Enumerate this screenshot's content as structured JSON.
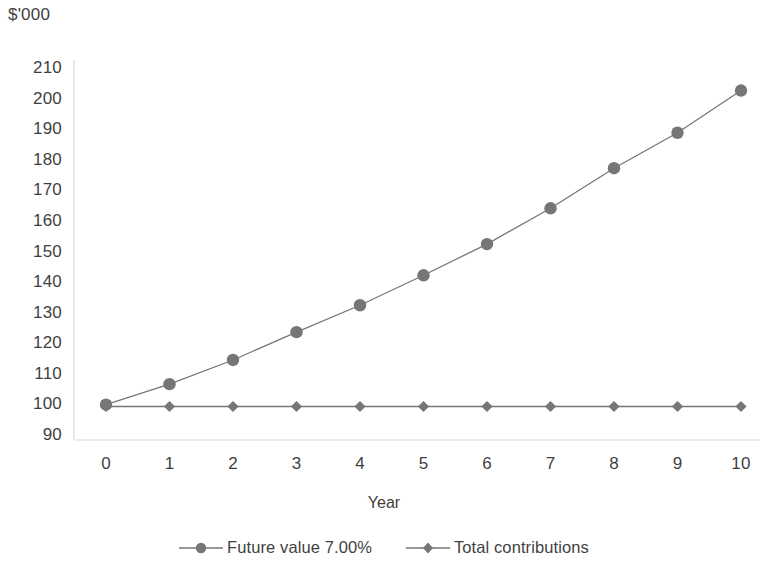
{
  "chart_data": {
    "type": "line",
    "title": "",
    "xlabel": "Year",
    "ylabel": "$'000",
    "x": [
      0,
      1,
      2,
      3,
      4,
      5,
      6,
      7,
      8,
      9,
      10
    ],
    "categories": [
      "0",
      "1",
      "2",
      "3",
      "4",
      "5",
      "6",
      "7",
      "8",
      "9",
      "10"
    ],
    "series": [
      {
        "name": "Future value 7.00%",
        "marker": "circle",
        "color": "#767676",
        "values": [
          99.6,
          106.3,
          114.2,
          123.3,
          132.1,
          141.9,
          152.1,
          163.8,
          176.9,
          188.5,
          202.3
        ]
      },
      {
        "name": "Total contributions",
        "marker": "diamond",
        "color": "#767676",
        "values": [
          99.0,
          99.0,
          99.0,
          99.0,
          99.0,
          99.0,
          99.0,
          99.0,
          99.0,
          99.0,
          99.0
        ]
      }
    ],
    "xlim": [
      0,
      10
    ],
    "ylim": [
      90,
      210
    ],
    "ytick_labels": [
      "210",
      "200",
      "190",
      "180",
      "170",
      "160",
      "150",
      "140",
      "130",
      "120",
      "110",
      "100",
      "90"
    ],
    "ytick_values": [
      210,
      200,
      190,
      180,
      170,
      160,
      150,
      140,
      130,
      120,
      110,
      100,
      90
    ],
    "xtick_labels": [
      "0",
      "1",
      "2",
      "3",
      "4",
      "5",
      "6",
      "7",
      "8",
      "9",
      "10"
    ],
    "grid": false,
    "legend_position": "bottom",
    "axis_color": "#d9d9d9",
    "text_color": "#3f3f3f"
  },
  "legend": {
    "items": [
      {
        "label": "Future value 7.00%",
        "marker": "circle-marker"
      },
      {
        "label": "Total contributions",
        "marker": "diamond-marker"
      }
    ]
  }
}
